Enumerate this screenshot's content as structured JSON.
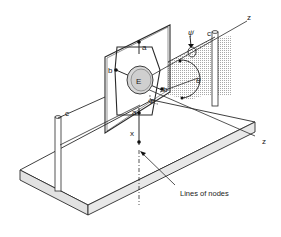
{
  "diagram": {
    "caption": "Lines of nodes",
    "labels": {
      "z_top": "z",
      "z_bottom": "z",
      "a_top": "a",
      "a_bottom": "a",
      "b_left": "b",
      "b_right": "b",
      "c_left": "c",
      "c_right": "c",
      "E": "E",
      "theta": "θ",
      "phi": "Φ",
      "psi": "ψ̇",
      "x": "x"
    },
    "colors": {
      "line": "#2a2a2a",
      "shade": "#bdbdbd",
      "base_side": "#e2e2e2"
    }
  }
}
